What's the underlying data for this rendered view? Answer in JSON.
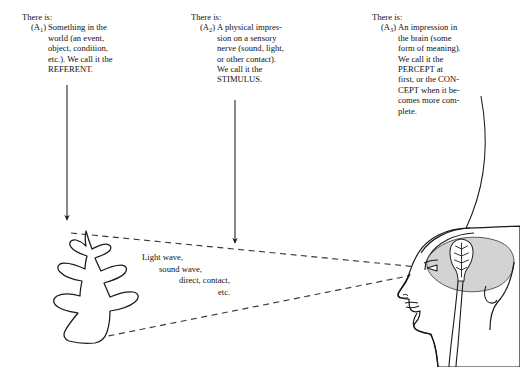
{
  "figure": {
    "line_color": "#1a1a1a",
    "brain_fill": "#d3d3d3",
    "background": "#ffffff"
  },
  "blocks": [
    {
      "there_is": "There is:",
      "tag_prefix": "(A",
      "tag_sub": "1",
      "tag_suffix": ")",
      "lines": [
        "Something in the",
        "world (an event,",
        "object, condition,",
        "etc.). We call it the",
        "REFERENT."
      ]
    },
    {
      "there_is": "There is:",
      "tag_prefix": "(A",
      "tag_sub": "2",
      "tag_suffix": ")",
      "lines": [
        "A physical impres-",
        "sion on a sensory",
        "nerve (sound, light,",
        "or other contact).",
        "We call it the",
        "STIMULUS."
      ]
    },
    {
      "there_is": "There is:",
      "tag_prefix": "(A",
      "tag_sub": "3",
      "tag_suffix": ")",
      "lines": [
        "An impression in",
        "the brain (some",
        "form of meaning).",
        "We call it the",
        "PERCEPT at",
        "first, or the CON-",
        "CEPT when it be-",
        "comes more com-",
        "plete."
      ]
    }
  ],
  "middle_label": {
    "line1": "Light wave,",
    "line2": "sound wave,",
    "line3": "direct, contact,",
    "line4": "etc."
  },
  "graphics": {
    "tree_name": "referent-tree",
    "head_name": "profile-head",
    "brain_tree_name": "percept-tree",
    "arrow_1_name": "arrow-to-referent",
    "arrow_2_name": "arrow-to-stimulus",
    "arrow_3_name": "arrow-to-percept",
    "sightline_upper_name": "sightline-upper",
    "sightline_lower_name": "sightline-lower"
  }
}
